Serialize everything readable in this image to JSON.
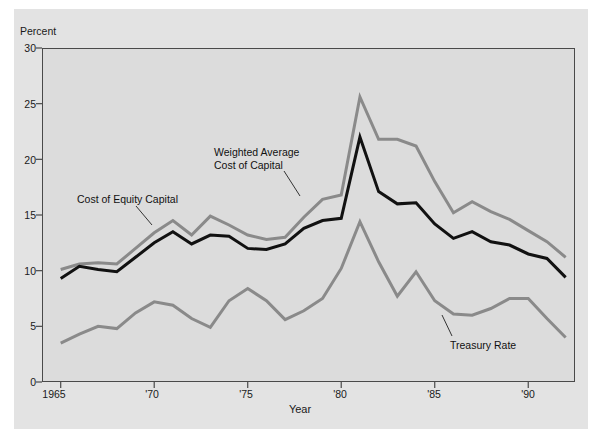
{
  "figure": {
    "background_color": "#ffffff",
    "panel_color": "#e3e3e3",
    "plot_background_color": "#dcdcdc",
    "frame_color": "#4a4a4a"
  },
  "axes": {
    "y_axis_title": "Percent",
    "x_axis_title": "Year",
    "y_ticks": [
      "0",
      "5",
      "10",
      "15",
      "20",
      "25",
      "30"
    ],
    "x_ticks": [
      "1965",
      "'70",
      "'75",
      "'80",
      "'85",
      "'90"
    ]
  },
  "annotations": {
    "cost_of_equity_capital": "Cost of Equity Capital",
    "weighted_average_cost_of_capital_line1": "Weighted Average",
    "weighted_average_cost_of_capital_line2": "Cost of Capital",
    "treasury_rate": "Treasury Rate"
  },
  "colors": {
    "gray_series": "#8a8a8a",
    "black_series": "#111111",
    "text": "#1a1a1a"
  },
  "chart_data": {
    "type": "line",
    "title": "",
    "subtitle": "",
    "xlabel": "Year",
    "ylabel": "Percent",
    "xlim": [
      1964,
      1992.5
    ],
    "ylim": [
      0,
      30
    ],
    "grid": false,
    "legend_position": "inline-annotations",
    "x": [
      1965,
      1966,
      1967,
      1968,
      1969,
      1970,
      1971,
      1972,
      1973,
      1974,
      1975,
      1976,
      1977,
      1978,
      1979,
      1980,
      1981,
      1982,
      1983,
      1984,
      1985,
      1986,
      1987,
      1988,
      1989,
      1990,
      1991,
      1992
    ],
    "series": [
      {
        "name": "Cost of Equity Capital",
        "color": "#8a8a8a",
        "width": 3,
        "values": [
          10.1,
          10.6,
          10.7,
          10.6,
          12.0,
          13.4,
          14.5,
          13.2,
          14.9,
          14.1,
          13.2,
          12.8,
          13.0,
          14.8,
          16.4,
          16.8,
          25.6,
          21.8,
          21.8,
          21.2,
          18.0,
          15.2,
          16.2,
          15.3,
          14.6,
          13.6,
          12.6,
          11.2
        ]
      },
      {
        "name": "Weighted Average Cost of Capital",
        "color": "#111111",
        "width": 3,
        "values": [
          9.3,
          10.4,
          10.1,
          9.9,
          11.2,
          12.5,
          13.5,
          12.4,
          13.2,
          13.1,
          12.0,
          11.9,
          12.4,
          13.8,
          14.5,
          14.7,
          22.0,
          17.1,
          16.0,
          16.1,
          14.2,
          12.9,
          13.5,
          12.6,
          12.3,
          11.5,
          11.1,
          9.4
        ]
      },
      {
        "name": "Treasury Rate",
        "color": "#8a8a8a",
        "width": 3,
        "values": [
          3.5,
          4.3,
          5.0,
          4.8,
          6.2,
          7.2,
          6.9,
          5.7,
          4.9,
          7.3,
          8.4,
          7.3,
          5.6,
          6.4,
          7.5,
          10.2,
          14.4,
          10.8,
          7.7,
          9.9,
          7.3,
          6.1,
          6.0,
          6.6,
          7.5,
          7.5,
          5.7,
          4.0
        ]
      }
    ]
  }
}
